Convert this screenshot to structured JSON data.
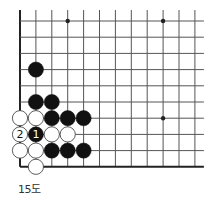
{
  "diagram": {
    "caption": "15도",
    "grid": {
      "cols": 12,
      "rows": 10,
      "x0": 20,
      "y0": 21,
      "dx": 15.9,
      "dy": 16.2,
      "edges": {
        "left": true,
        "bottom": true,
        "top": false,
        "right": false
      }
    },
    "star_points": [
      [
        3,
        0
      ],
      [
        9,
        0
      ],
      [
        9,
        6
      ]
    ],
    "stones": [
      {
        "color": "black",
        "col": 1,
        "row": 3,
        "label": ""
      },
      {
        "color": "black",
        "col": 1,
        "row": 5,
        "label": ""
      },
      {
        "color": "black",
        "col": 2,
        "row": 5,
        "label": ""
      },
      {
        "color": "white",
        "col": 0,
        "row": 6,
        "label": ""
      },
      {
        "color": "white",
        "col": 1,
        "row": 6,
        "label": ""
      },
      {
        "color": "black",
        "col": 2,
        "row": 6,
        "label": ""
      },
      {
        "color": "black",
        "col": 3,
        "row": 6,
        "label": ""
      },
      {
        "color": "black",
        "col": 4,
        "row": 6,
        "label": ""
      },
      {
        "color": "white",
        "col": 0,
        "row": 7,
        "label": "2"
      },
      {
        "color": "black",
        "col": 1,
        "row": 7,
        "label": "1"
      },
      {
        "color": "white",
        "col": 2,
        "row": 7,
        "label": ""
      },
      {
        "color": "white",
        "col": 3,
        "row": 7,
        "label": ""
      },
      {
        "color": "white",
        "col": 0,
        "row": 8,
        "label": ""
      },
      {
        "color": "white",
        "col": 1,
        "row": 8,
        "label": ""
      },
      {
        "color": "black",
        "col": 2,
        "row": 8,
        "label": ""
      },
      {
        "color": "black",
        "col": 3,
        "row": 8,
        "label": ""
      },
      {
        "color": "black",
        "col": 4,
        "row": 8,
        "label": ""
      },
      {
        "color": "white",
        "col": 1,
        "row": 9,
        "label": ""
      }
    ],
    "colors": {
      "black": "#111111",
      "white": "#ffffff",
      "line": "#555555",
      "edge": "#222222"
    }
  }
}
